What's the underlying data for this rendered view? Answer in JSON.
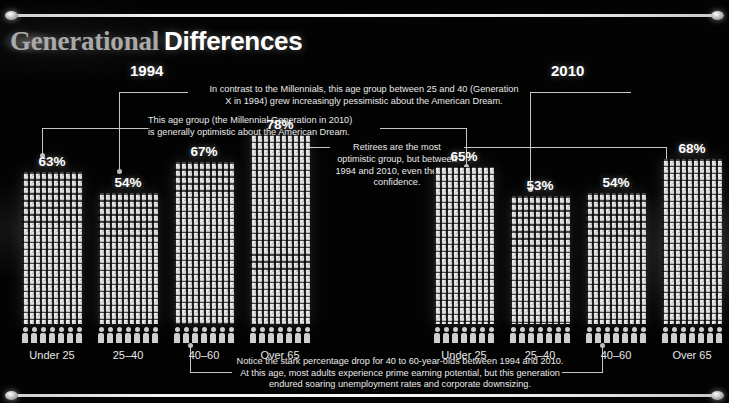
{
  "title": {
    "word1": "Generational",
    "word2": "Differences"
  },
  "years": {
    "left": "1994",
    "right": "2010"
  },
  "chart_data": {
    "type": "bar",
    "xlabel": "",
    "ylabel": "Percent optimistic about the American Dream",
    "ylim": [
      0,
      100
    ],
    "grid": false,
    "legend": "none",
    "categories": [
      "Under 25",
      "25–40",
      "40–60",
      "Over 65"
    ],
    "series": [
      {
        "name": "1994",
        "values": [
          63,
          54,
          67,
          78
        ]
      },
      {
        "name": "2010",
        "values": [
          65,
          53,
          54,
          68
        ]
      }
    ],
    "value_labels": {
      "1994": [
        "63%",
        "54%",
        "67%",
        "78%"
      ],
      "2010": [
        "65%",
        "53%",
        "54%",
        "68%"
      ]
    },
    "annotations": [
      "In contrast to the Millennials, this age group between 25 and 40 (Generation X in 1994) grew increasingly pessimistic about the American Dream.",
      "This age group (the Millennial Generation in 2010) is generally optimistic about the American Dream.",
      "Retirees are the most optimistic group, but between 1994 and 2010, even they lost confidence.",
      "Notice the stark percentage drop for 40 to 60-year-olds between 1994 and 2010. At this age, most adults experience prime earning potential, but this generation endured soaring unemployment rates and corporate downsizing."
    ]
  },
  "charts": {
    "c1994": {
      "bars": [
        {
          "label": "Under 25",
          "pct": "63%",
          "value": 63
        },
        {
          "label": "25–40",
          "pct": "54%",
          "value": 54
        },
        {
          "label": "40–60",
          "pct": "67%",
          "value": 67
        },
        {
          "label": "Over 65",
          "pct": "78%",
          "value": 78
        }
      ]
    },
    "c2010": {
      "bars": [
        {
          "label": "Under 25",
          "pct": "65%",
          "value": 65
        },
        {
          "label": "25–40",
          "pct": "53%",
          "value": 53
        },
        {
          "label": "40–60",
          "pct": "54%",
          "value": 54
        },
        {
          "label": "Over 65",
          "pct": "68%",
          "value": 68
        }
      ]
    }
  },
  "notes": {
    "genx_line1": "In contrast to the Millennials, this age group between 25 and 40 (Generation",
    "genx_line2": "X in 1994) grew increasingly pessimistic about the American Dream.",
    "millennial_line1": "This age group (the Millennial Generation in 2010)",
    "millennial_line2": "is generally optimistic about the American Dream.",
    "retirees": "Retirees are the most optimistic group, but between 1994 and 2010, even they lost confidence.",
    "drop_line1": "Notice the stark percentage drop for 40 to 60-year-olds between 1994 and 2010.",
    "drop_line2": "At this age, most adults experience prime earning potential, but this generation",
    "drop_line3": "endured soaring unemployment rates and corporate downsizing."
  },
  "colors": {
    "background": "#030303",
    "bar": "#cfcfcf",
    "text": "#ffffff",
    "leader": "#c6c6c6",
    "title_serif": "#a9a9a9"
  }
}
